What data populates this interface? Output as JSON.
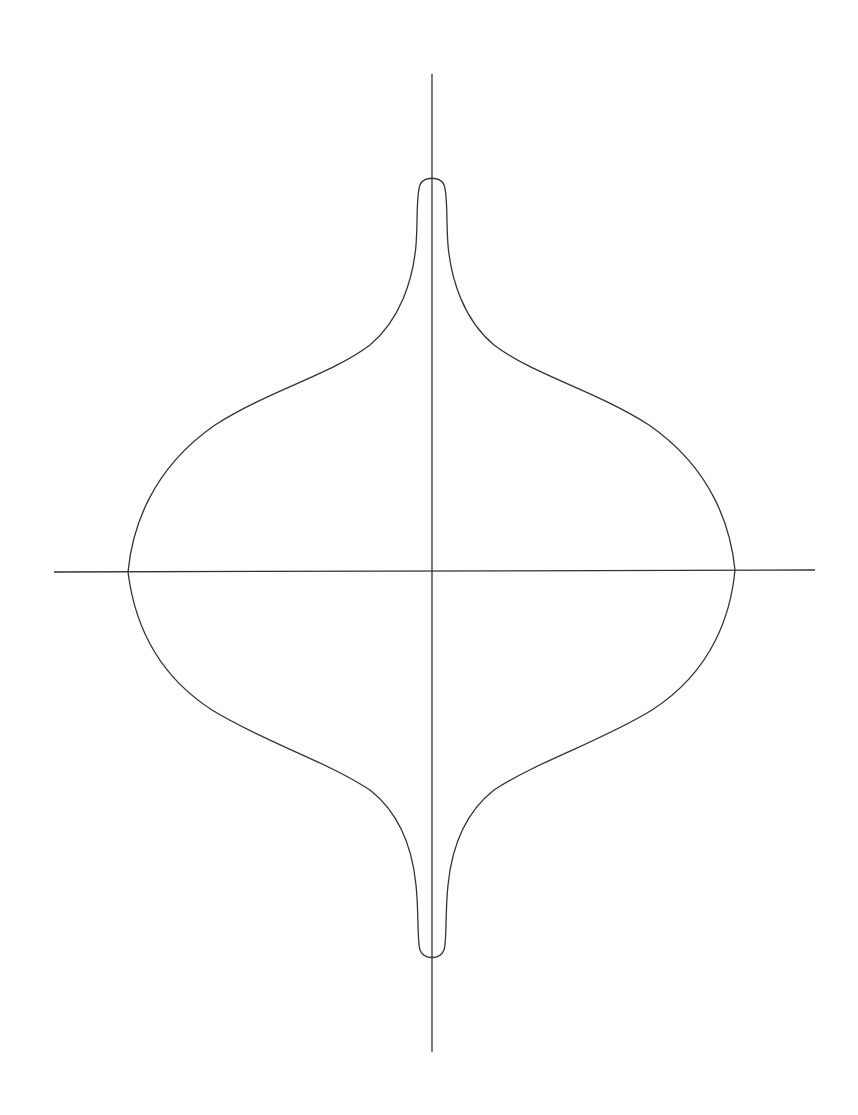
{
  "figure": {
    "stroke_color": "#333333",
    "background": "#ffffff",
    "axes": {
      "horizontal": {
        "x1": 54,
        "y1": 572,
        "x2": 815,
        "y2": 570
      },
      "vertical": {
        "x1": 432,
        "y1": 74,
        "x2": 432,
        "y2": 1052
      }
    },
    "curve": {
      "left_x_intercept": [
        128,
        572
      ],
      "right_x_intercept": [
        735,
        570
      ],
      "top_apex": [
        432,
        176
      ],
      "bottom_apex": [
        432,
        958
      ],
      "path": "M 128 572 C 132 530, 150 470, 215 425 C 270 390, 330 375, 370 345 C 400 320, 413 280, 416 245 C 418 220, 416 195, 420 185 C 424 176, 440 176, 444 185 C 448 195, 446 220, 448 245 C 451 280, 464 320, 494 345 C 534 375, 594 390, 649 425 C 714 470, 731 530, 735 570 C 731 612, 714 670, 652 710 C 600 742, 540 760, 494 790 C 466 812, 452 845, 448 885 C 445 915, 447 940, 444 950 C 440 960, 424 960, 420 950 C 417 940, 419 915, 416 885 C 412 845, 398 812, 370 790 C 324 760, 264 742, 212 710 C 150 670, 133 612, 128 572 Z"
    }
  }
}
